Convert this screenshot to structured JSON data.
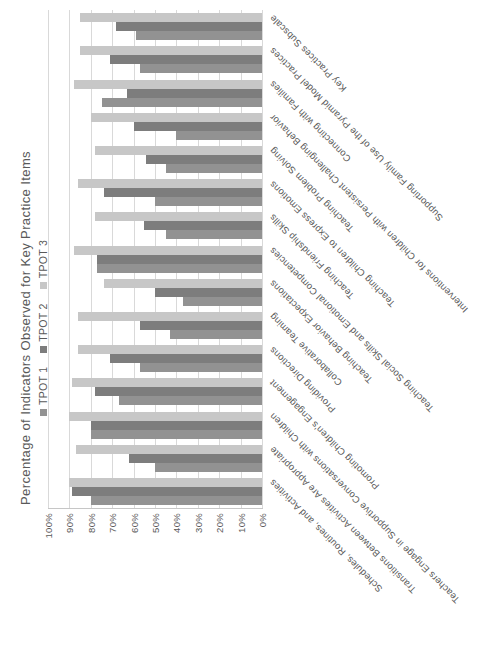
{
  "title": "Percentage of Indicators Observed for Key Practice Items",
  "legend": [
    {
      "label": "TPOT 1",
      "color": "#929292"
    },
    {
      "label": "TPOT 2",
      "color": "#7d7d7d"
    },
    {
      "label": "TPOT 3",
      "color": "#c7c7c7"
    }
  ],
  "colors": {
    "tpot1": "#929292",
    "tpot2": "#7d7d7d",
    "tpot3": "#c7c7c7",
    "gridline": "#d9d9d9",
    "axis_line": "#c6c6c6",
    "text": "#595959"
  },
  "chart_data": {
    "type": "bar",
    "title": "Percentage of Indicators Observed for Key Practice Items",
    "rotation": "whole chart rotated 90deg counterclockwise; value axis along bottom (100% left, 0% right), categories along right edge",
    "grid": true,
    "legend_position": "top",
    "ylim": [
      0,
      100
    ],
    "y_ticks": [
      "100%",
      "90%",
      "80%",
      "70%",
      "60%",
      "50%",
      "40%",
      "30%",
      "20%",
      "10%",
      "0%"
    ],
    "categories": [
      "Schedules, Routines, and Activities",
      "Transitions Between Activities Are Appropriate",
      "Teachers Engage in Supportive Conversations with Children",
      "Promoting Children's Engagement",
      "Providing Directions",
      "Collaborative Teaming",
      "Teaching Behavior Expectations",
      "Teaching Social Skills and Emotional Competencies",
      "Teaching Friendship Skills",
      "Teaching Children to Express Emotions",
      "Teaching Problem Solving",
      "Interventions for Children with Persistent Challenging Behavior",
      "Connecting with Families",
      "Supporting Family Use of the Pyramid Model Practices",
      "Key Practices Subscale"
    ],
    "series": [
      {
        "name": "TPOT 1",
        "color": "#929292",
        "values": [
          80,
          50,
          80,
          67,
          57,
          43,
          37,
          77,
          45,
          50,
          45,
          40,
          75,
          57,
          59
        ]
      },
      {
        "name": "TPOT 2",
        "color": "#7d7d7d",
        "values": [
          89,
          62,
          80,
          78,
          71,
          57,
          50,
          77,
          55,
          74,
          54,
          60,
          63,
          71,
          68
        ]
      },
      {
        "name": "TPOT 3",
        "color": "#c7c7c7",
        "values": [
          90,
          87,
          90,
          89,
          86,
          86,
          74,
          88,
          78,
          86,
          78,
          80,
          88,
          85,
          85
        ]
      }
    ]
  }
}
